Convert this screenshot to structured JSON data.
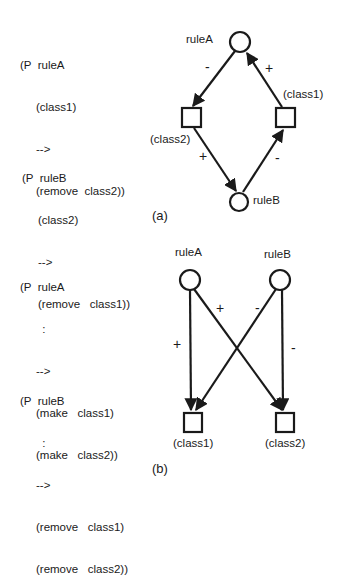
{
  "panel_a": {
    "caption": "(a)",
    "rules": [
      {
        "lines": [
          "(P  ruleA",
          "     (class1)",
          "     -->",
          "     (remove  class2))"
        ]
      },
      {
        "lines": [
          "(P  ruleB",
          "     (class2)",
          "     -->",
          "     (remove   class1))"
        ]
      }
    ],
    "nodes": {
      "ruleA": "ruleA",
      "ruleB": "ruleB",
      "class1": "(class1)",
      "class2": "(class2)"
    },
    "edges": [
      {
        "from": "ruleA",
        "to": "class2",
        "sign": "-"
      },
      {
        "from": "class1",
        "to": "ruleA",
        "sign": "+"
      },
      {
        "from": "class2",
        "to": "ruleB",
        "sign": "+"
      },
      {
        "from": "ruleB",
        "to": "class1",
        "sign": "-"
      }
    ]
  },
  "panel_b": {
    "caption": "(b)",
    "rules": [
      {
        "lines": [
          "(P  ruleA",
          "       :",
          "     -->",
          "     (make   class1)",
          "     (make   class2))"
        ]
      },
      {
        "lines": [
          "(P  ruleB",
          "       :",
          "     -->",
          "     (remove   class1)",
          "     (remove   class2))"
        ]
      }
    ],
    "nodes": {
      "ruleA": "ruleA",
      "ruleB": "ruleB",
      "class1": "(class1)",
      "class2": "(class2)"
    },
    "edges": [
      {
        "from": "ruleA",
        "to": "class1",
        "sign": "+"
      },
      {
        "from": "ruleA",
        "to": "class2",
        "sign": "+"
      },
      {
        "from": "ruleB",
        "to": "class1",
        "sign": "-"
      },
      {
        "from": "ruleB",
        "to": "class2",
        "sign": "-"
      }
    ]
  }
}
